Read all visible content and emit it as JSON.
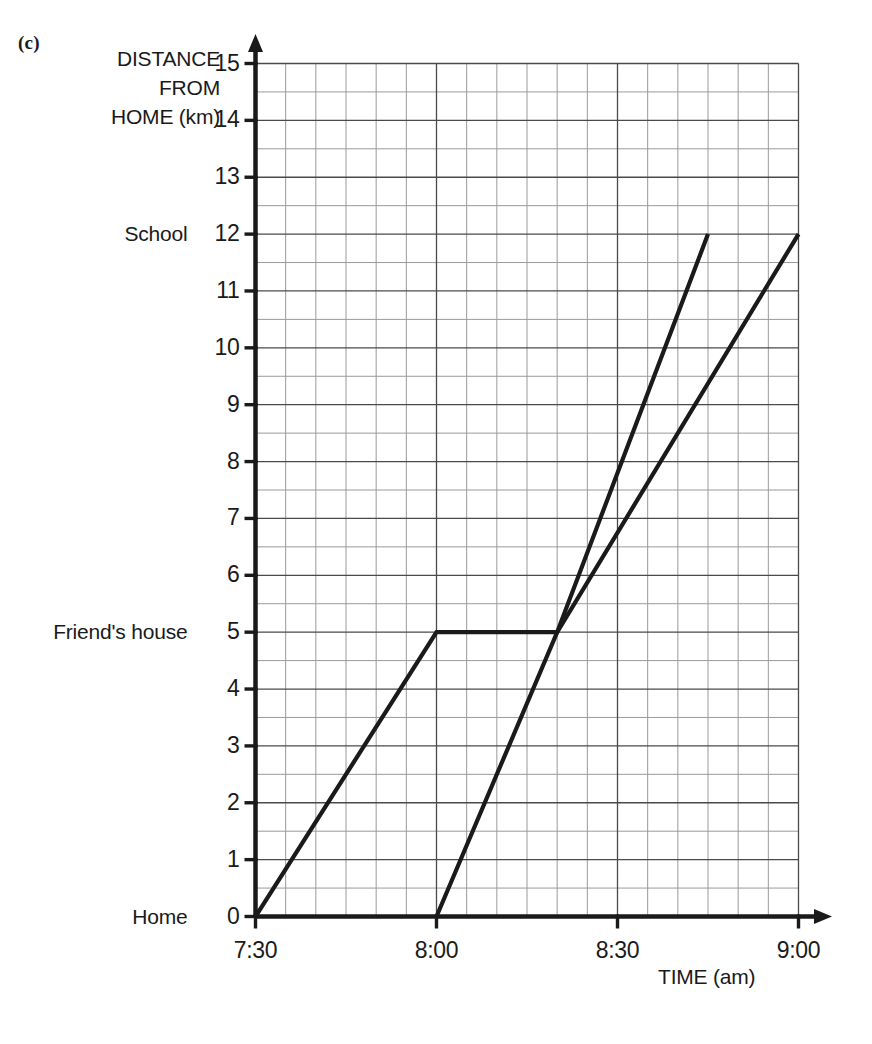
{
  "figure": {
    "part_label": "(c)",
    "y_axis_title_lines": [
      "DISTANCE",
      "FROM",
      "HOME (km)"
    ],
    "x_axis_title": "TIME (am)"
  },
  "chart_data": {
    "type": "line",
    "title": "",
    "xlabel": "TIME (am)",
    "ylabel": "DISTANCE FROM HOME (km)",
    "xlim": [
      "7:30",
      "9:00"
    ],
    "ylim": [
      0,
      15
    ],
    "grid": true,
    "legend": "none",
    "x_tick_labels": [
      "7:30",
      "8:00",
      "8:30",
      "9:00"
    ],
    "x_tick_minutes": [
      450,
      480,
      510,
      540
    ],
    "x_minor_step_minutes": 5,
    "y_tick_labels": [
      "0",
      "1",
      "2",
      "3",
      "4",
      "5",
      "6",
      "7",
      "8",
      "9",
      "10",
      "11",
      "12",
      "13",
      "14",
      "15"
    ],
    "y_tick_values": [
      0,
      1,
      2,
      3,
      4,
      5,
      6,
      7,
      8,
      9,
      10,
      11,
      12,
      13,
      14,
      15
    ],
    "y_minor_step": 0.5,
    "y_named_levels": [
      {
        "value": 0,
        "label": "Home"
      },
      {
        "value": 5,
        "label": "Friend's house"
      },
      {
        "value": 12,
        "label": "School"
      }
    ],
    "series": [
      {
        "name": "journey-1",
        "points": [
          {
            "time": "7:30",
            "minutes": 450,
            "km": 0
          },
          {
            "time": "8:00",
            "minutes": 480,
            "km": 5
          },
          {
            "time": "8:20",
            "minutes": 500,
            "km": 5
          },
          {
            "time": "8:45",
            "minutes": 525,
            "km": 12
          }
        ]
      },
      {
        "name": "journey-2",
        "points": [
          {
            "time": "8:00",
            "minutes": 480,
            "km": 0
          },
          {
            "time": "8:20",
            "minutes": 500,
            "km": 5
          },
          {
            "time": "9:00",
            "minutes": 540,
            "km": 12
          }
        ]
      }
    ]
  },
  "colors": {
    "ink": "#1a1a1a",
    "grid_major": "#4a4a4a",
    "grid_minor": "#9a9a9a",
    "background": "#ffffff"
  }
}
